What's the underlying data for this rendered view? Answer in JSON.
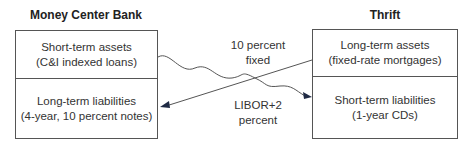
{
  "left_party": {
    "title": "Money Center Bank",
    "top": {
      "line1": "Short-term assets",
      "line2": "(C&I indexed loans)"
    },
    "bottom": {
      "line1": "Long-term liabilities",
      "line2": "(4-year, 10 percent notes)"
    }
  },
  "right_party": {
    "title": "Thrift",
    "top": {
      "line1": "Long-term assets",
      "line2": "(fixed-rate mortgages)"
    },
    "bottom": {
      "line1": "Short-term liabilities",
      "line2": "(1-year CDs)"
    }
  },
  "flows": {
    "fixed": {
      "line1": "10 percent",
      "line2": "fixed"
    },
    "floating": {
      "line1": "LIBOR+2",
      "line2": "percent"
    }
  },
  "colors": {
    "line": "#555555",
    "arrow": "#1f2a44"
  }
}
